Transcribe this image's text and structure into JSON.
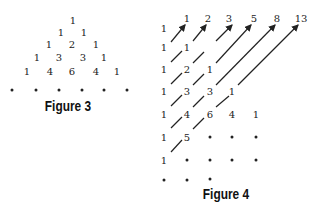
{
  "figure3": {
    "caption": "Figure 3",
    "rows": [
      [
        "1"
      ],
      [
        "1",
        "1"
      ],
      [
        "1",
        "2",
        "1"
      ],
      [
        "1",
        "3",
        "3",
        "1"
      ],
      [
        "1",
        "4",
        "6",
        "4",
        "1"
      ]
    ],
    "ellipsis_row_dots": 6
  },
  "figure4": {
    "caption": "Figure 4",
    "sums": [
      "1",
      "2",
      "3",
      "5",
      "8",
      "13"
    ],
    "rows": [
      [
        "1"
      ],
      [
        "1",
        "1"
      ],
      [
        "1",
        "2",
        "1"
      ],
      [
        "1",
        "3",
        "3",
        "1"
      ],
      [
        "1",
        "4",
        "6",
        "4",
        "1"
      ],
      [
        "1",
        "5"
      ],
      [
        "1"
      ]
    ]
  }
}
